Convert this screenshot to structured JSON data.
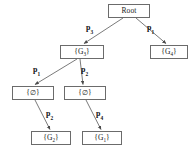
{
  "diagram": {
    "type": "tree",
    "line_color": "#6b6b6b",
    "text_color": "#1a1a1a",
    "background": "#ffffff",
    "nodes": [
      {
        "id": "root",
        "label": "Root",
        "sub": "",
        "x": 108,
        "y": 4,
        "w": 42,
        "h": 14,
        "level": 0
      },
      {
        "id": "g3",
        "label": "{G",
        "sub": "3",
        "suffix": "}",
        "x": 60,
        "y": 45,
        "w": 44,
        "h": 14,
        "level": 1
      },
      {
        "id": "g4",
        "label": "{G",
        "sub": "4",
        "suffix": "}",
        "x": 150,
        "y": 45,
        "w": 38,
        "h": 14,
        "level": 1
      },
      {
        "id": "e1",
        "label": "{",
        "sub": "",
        "suffix": "}",
        "symbol": "∅",
        "x": 12,
        "y": 86,
        "w": 42,
        "h": 14,
        "level": 2
      },
      {
        "id": "e2",
        "label": "{",
        "sub": "",
        "suffix": "}",
        "symbol": "∅",
        "x": 64,
        "y": 86,
        "w": 42,
        "h": 14,
        "level": 2
      },
      {
        "id": "g2",
        "label": "{G",
        "sub": "2",
        "suffix": "}",
        "x": 31,
        "y": 131,
        "w": 40,
        "h": 14,
        "level": 3
      },
      {
        "id": "g1",
        "label": "{G",
        "sub": "1",
        "suffix": "}",
        "x": 82,
        "y": 131,
        "w": 40,
        "h": 14,
        "level": 3
      }
    ],
    "edges": [
      {
        "id": "root-g3",
        "from": "root",
        "to": "g3",
        "label": "p",
        "sub": "3",
        "lx": 86,
        "ly": 24
      },
      {
        "id": "root-g4",
        "from": "root",
        "to": "g4",
        "label": "p",
        "sub": "1",
        "lx": 147,
        "ly": 24
      },
      {
        "id": "g3-e1",
        "from": "g3",
        "to": "e1",
        "label": "p",
        "sub": "1",
        "lx": 33,
        "ly": 66
      },
      {
        "id": "g3-e2",
        "from": "g3",
        "to": "e2",
        "label": "p",
        "sub": "2",
        "lx": 81,
        "ly": 66
      },
      {
        "id": "e1-g2",
        "from": "e1",
        "to": "g2",
        "label": "p",
        "sub": "2",
        "lx": 46,
        "ly": 110
      },
      {
        "id": "e2-g1",
        "from": "e2",
        "to": "g1",
        "label": "p",
        "sub": "4",
        "lx": 96,
        "ly": 110
      }
    ],
    "node_labels": {
      "root": "Root",
      "g3": "{G3}",
      "g4": "{G4}",
      "e1": "{∅}",
      "e2": "{∅}",
      "g2": "{G2}",
      "g1": "{G1}"
    },
    "edge_labels": {
      "root_left": "p3",
      "root_right": "p1",
      "g3_left": "p1",
      "g3_right": "p2",
      "e1_down": "p2",
      "e2_down": "p4"
    }
  }
}
